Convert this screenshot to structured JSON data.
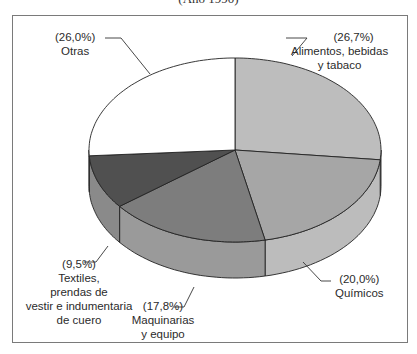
{
  "chart_data": {
    "type": "pie",
    "title": "(Año 1990)",
    "style": "3d",
    "unit": "%",
    "start_angle_deg": 90,
    "direction": "clockwise",
    "slices": [
      {
        "label": "Alimentos, bebidas y tabaco",
        "value": 26.7,
        "pct_label": "(26,7%)",
        "top_color": "#bdbdbd",
        "side_color": "#c9c9c9"
      },
      {
        "label": "Químicos",
        "value": 20.0,
        "pct_label": "(20,0%)",
        "top_color": "#a6a6a6",
        "side_color": "#bcbcbc"
      },
      {
        "label": "Maquinarias y equipo",
        "value": 17.8,
        "pct_label": "(17,8%)",
        "top_color": "#7d7d7d",
        "side_color": "#9a9a9a"
      },
      {
        "label": "Textiles, prendas de vestir e indumentaria de cuero",
        "value": 9.5,
        "pct_label": "(9,5%)",
        "top_color": "#505050",
        "side_color": "#8a8a8a"
      },
      {
        "label": "Otras",
        "value": 26.0,
        "pct_label": "(26,0%)",
        "top_color": "#ffffff",
        "side_color": "#f2f2f2"
      }
    ],
    "geometry": {
      "cx": 235,
      "cy": 150,
      "rx": 146,
      "ry": 92,
      "depth": 36
    }
  },
  "labels": {
    "alimentos": {
      "pct": "(26,7%)",
      "lines": [
        "Alimentos, bebidas",
        "y tabaco"
      ]
    },
    "quimicos": {
      "pct": "(20,0%)",
      "lines": [
        "Químicos"
      ]
    },
    "maquinarias": {
      "pct": "(17,8%)",
      "lines": [
        "Maquinarias",
        "y equipo"
      ]
    },
    "textiles": {
      "pct": "(9,5%)",
      "lines": [
        "Textiles,",
        "prendas de",
        "vestir e indumentaria",
        "de cuero"
      ]
    },
    "otras": {
      "pct": "(26,0%)",
      "lines": [
        "Otras"
      ]
    }
  }
}
